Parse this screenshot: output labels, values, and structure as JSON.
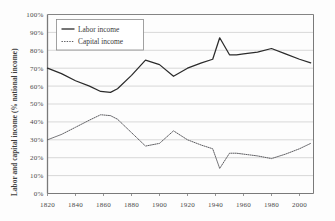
{
  "chart_data": {
    "type": "line",
    "title": "",
    "xlabel": "",
    "ylabel": "Labor and capital income (% national income)",
    "xlim": [
      1820,
      2010
    ],
    "ylim": [
      0,
      100
    ],
    "grid": true,
    "legend_position": "top-left",
    "xticks": [
      "1820",
      "1840",
      "1860",
      "1880",
      "1900",
      "1920",
      "1940",
      "1960",
      "1980",
      "2000"
    ],
    "xtick_values": [
      1820,
      1840,
      1860,
      1880,
      1900,
      1920,
      1940,
      1960,
      1980,
      2000
    ],
    "yticks": [
      "0%",
      "10%",
      "20%",
      "30%",
      "40%",
      "50%",
      "60%",
      "70%",
      "80%",
      "90%",
      "100%"
    ],
    "ytick_values": [
      0,
      10,
      20,
      30,
      40,
      50,
      60,
      70,
      80,
      90,
      100
    ],
    "series": [
      {
        "name": "Labor income",
        "style": "solid",
        "color": "#2b2b2b",
        "x": [
          1820,
          1830,
          1840,
          1850,
          1858,
          1865,
          1870,
          1880,
          1890,
          1900,
          1910,
          1920,
          1930,
          1938,
          1943,
          1950,
          1955,
          1960,
          1970,
          1980,
          1990,
          2000,
          2008
        ],
        "values": [
          70,
          67,
          63,
          60,
          57,
          56.5,
          58.5,
          66,
          74.5,
          72,
          65.5,
          70,
          73,
          75,
          87,
          77.5,
          77.5,
          78,
          79,
          81,
          78,
          75,
          73
        ]
      },
      {
        "name": "Capital income",
        "style": "dotted",
        "color": "#55555a",
        "x": [
          1820,
          1830,
          1840,
          1850,
          1858,
          1865,
          1870,
          1880,
          1890,
          1900,
          1910,
          1920,
          1930,
          1938,
          1943,
          1950,
          1955,
          1960,
          1970,
          1980,
          1990,
          2000,
          2008
        ],
        "values": [
          30,
          33,
          37,
          41,
          44,
          43.5,
          41.5,
          34,
          26.5,
          28,
          35,
          30,
          27,
          25,
          14,
          22.5,
          22.5,
          22,
          21,
          19.5,
          22,
          25,
          28
        ]
      }
    ]
  },
  "legend": {
    "items": [
      {
        "label": "Labor income",
        "style": "solid"
      },
      {
        "label": "Capital income",
        "style": "dotted"
      }
    ]
  },
  "axes": {
    "y_axis_title": "Labor and capital income (% national income)"
  }
}
